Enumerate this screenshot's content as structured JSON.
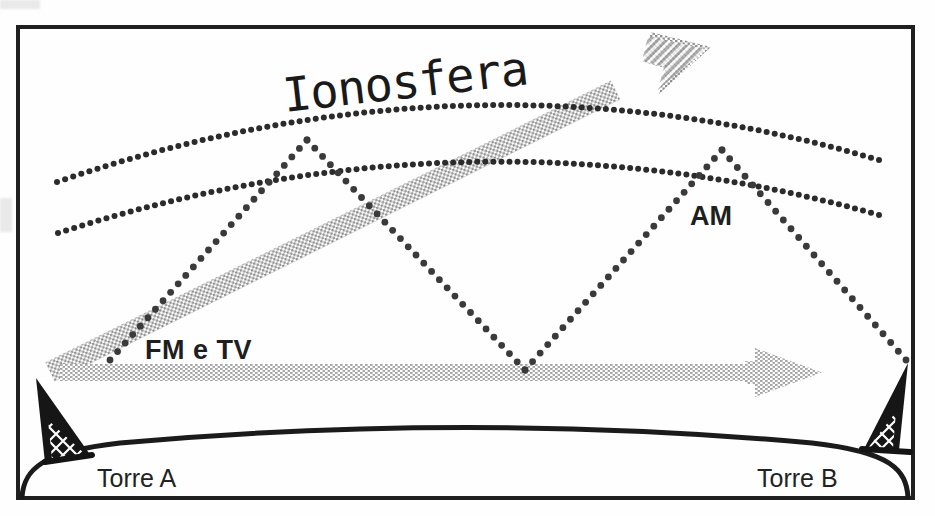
{
  "diagram": {
    "title_label": "Ionosfera",
    "labels": {
      "ionosphere": "Ionosfera",
      "am_wave": "AM",
      "fm_tv_wave": "FM e TV",
      "tower_left": "Torre A",
      "tower_right": "Torre B"
    },
    "colors": {
      "ink": "#1b1b1b",
      "dotted_ray": "#3a3a3a",
      "ionosphere_dots": "#2b2b2b",
      "gray_band": "#b4b4b4",
      "gray_band_light": "#c9c9c9",
      "tower_fill": "#1a1a1a",
      "background": "#ffffff",
      "frame": "#202020"
    },
    "elements": {
      "frame": {
        "x": 18,
        "y": 27,
        "width": 895,
        "height": 471,
        "stroke_width": 4
      },
      "ionosphere_upper_arc": {
        "start": [
          57,
          182
        ],
        "control": [
          470,
          40
        ],
        "end": [
          879,
          160
        ],
        "dot_radius": 3.0,
        "dot_spacing": 8.2
      },
      "ionosphere_lower_arc": {
        "start": [
          58,
          233
        ],
        "control": [
          470,
          100
        ],
        "end": [
          879,
          215
        ],
        "dot_radius": 3.0,
        "dot_spacing": 8.2
      },
      "am_ray_segments": [
        {
          "name": "tower-a-to-ionosphere",
          "from": [
            110,
            360
          ],
          "to": [
            307,
            140
          ]
        },
        {
          "name": "ionosphere-to-ground",
          "from": [
            307,
            140
          ],
          "to": [
            525,
            370
          ]
        },
        {
          "name": "ground-to-ionosphere",
          "from": [
            525,
            370
          ],
          "to": [
            722,
            150
          ]
        },
        {
          "name": "ionosphere-to-tower-b",
          "from": [
            722,
            150
          ],
          "to": [
            906,
            360
          ]
        }
      ],
      "am_ray_dot_radius": 3.4,
      "am_ray_dot_spacing": 11.5,
      "fm_tv_diagonal_band": {
        "from": [
          50,
          372
        ],
        "to": [
          672,
          62
        ],
        "thickness": 21,
        "head_length": 58,
        "head_width": 52
      },
      "fm_tv_horizontal_band": {
        "from": [
          60,
          372
        ],
        "to": [
          760,
          372
        ],
        "thickness": 17,
        "head_length": 62,
        "head_width": 52
      },
      "earth_curve": {
        "left": [
          22,
          495
        ],
        "control": [
          468,
          415
        ],
        "right": [
          908,
          495
        ],
        "stroke_width": 5
      },
      "tower_left": {
        "apex": [
          36,
          378
        ],
        "base_left": [
          45,
          462
        ],
        "base_right": [
          90,
          455
        ]
      },
      "tower_right": {
        "apex": [
          908,
          365
        ],
        "base_left": [
          866,
          448
        ],
        "base_right": [
          911,
          455
        ]
      }
    },
    "text_positions": {
      "ionosfera": {
        "x": 285,
        "y": 70,
        "font_size": 46,
        "rotate": -5.5
      },
      "am": {
        "x": 690,
        "y": 202,
        "font_size": 27
      },
      "fm_e_tv": {
        "x": 145,
        "y": 335,
        "font_size": 27
      },
      "torre_a": {
        "x": 95,
        "y": 462,
        "font_size": 25
      },
      "torre_b": {
        "x": 755,
        "y": 462,
        "font_size": 25
      }
    }
  }
}
